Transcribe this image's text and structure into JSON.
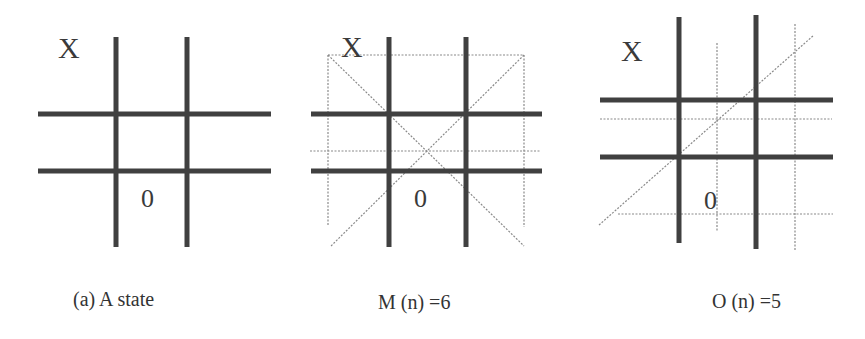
{
  "figure": {
    "panels": [
      {
        "id": "a",
        "caption": "(a) A state",
        "x_mark": "X",
        "o_mark": "0",
        "winning_lines_drawn": 0
      },
      {
        "id": "m",
        "caption": "M (n) =6",
        "x_mark": "X",
        "o_mark": "0",
        "winning_lines_drawn": 6
      },
      {
        "id": "o",
        "caption": "O (n) =5",
        "x_mark": "X",
        "o_mark": "0",
        "winning_lines_drawn": 5
      }
    ],
    "colors": {
      "grid": "#404040",
      "dotted": "#8a8a8a",
      "text": "#333333",
      "background": "#ffffff"
    }
  }
}
